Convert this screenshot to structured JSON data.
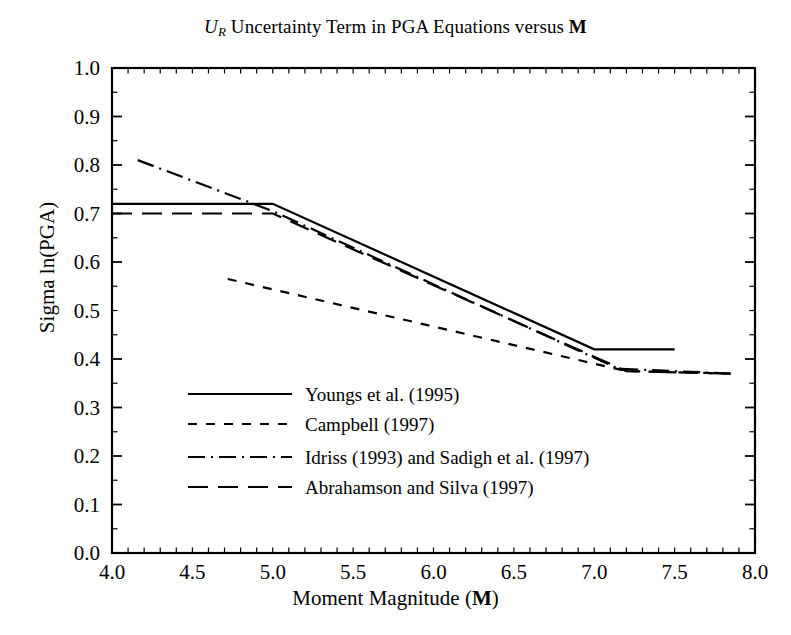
{
  "title": {
    "symbol": "U",
    "subscript": "R",
    "text_mid": " Uncertainty Term in PGA Equations versus ",
    "bold_tail": "M",
    "full": "U_R Uncertainty Term in PGA Equations versus M"
  },
  "axes": {
    "xlabel_pre": "Moment Magnitude (",
    "xlabel_bold": "M",
    "xlabel_post": ")",
    "ylabel": "Sigma ln(PGA)",
    "xticks": [
      "4.0",
      "4.5",
      "5.0",
      "5.5",
      "6.0",
      "6.5",
      "7.0",
      "7.5",
      "8.0"
    ],
    "yticks": [
      "0.0",
      "0.1",
      "0.2",
      "0.3",
      "0.4",
      "0.5",
      "0.6",
      "0.7",
      "0.8",
      "0.9",
      "1.0"
    ]
  },
  "legend": {
    "items": [
      {
        "label": "Youngs et al. (1995)",
        "style": "solid"
      },
      {
        "label": "Campbell (1997)",
        "style": "short-dash"
      },
      {
        "label": "Idriss (1993) and Sadigh et al. (1997)",
        "style": "dash-dot"
      },
      {
        "label": "Abrahamson and Silva (1997)",
        "style": "long-dash"
      }
    ]
  },
  "colors": {
    "line": "#000000",
    "axis": "#000000",
    "background": "#ffffff"
  },
  "chart_data": {
    "type": "line",
    "xlabel": "Moment Magnitude (M)",
    "ylabel": "Sigma ln(PGA)",
    "xlim": [
      4.0,
      8.0
    ],
    "ylim": [
      0.0,
      1.0
    ],
    "xticks": [
      4.0,
      4.5,
      5.0,
      5.5,
      6.0,
      6.5,
      7.0,
      7.5,
      8.0
    ],
    "yticks": [
      0.0,
      0.1,
      0.2,
      0.3,
      0.4,
      0.5,
      0.6,
      0.7,
      0.8,
      0.9,
      1.0
    ],
    "x_minor_tick_step": 0.1,
    "y_minor_tick_step": 0.05,
    "grid": false,
    "legend_position": "inside lower-left",
    "series": [
      {
        "name": "Youngs et al. (1995)",
        "style": "solid",
        "points": [
          [
            4.0,
            0.72
          ],
          [
            5.0,
            0.72
          ],
          [
            7.0,
            0.42
          ],
          [
            7.5,
            0.42
          ]
        ]
      },
      {
        "name": "Campbell (1997)",
        "style": "short-dash",
        "points": [
          [
            4.72,
            0.565
          ],
          [
            7.2,
            0.375
          ],
          [
            7.85,
            0.37
          ]
        ]
      },
      {
        "name": "Idriss (1993) and Sadigh et al. (1997)",
        "style": "dash-dot",
        "points": [
          [
            4.16,
            0.81
          ],
          [
            5.0,
            0.705
          ],
          [
            7.15,
            0.38
          ],
          [
            7.85,
            0.37
          ]
        ]
      },
      {
        "name": "Abrahamson and Silva (1997)",
        "style": "long-dash",
        "points": [
          [
            4.0,
            0.7
          ],
          [
            5.0,
            0.7
          ],
          [
            7.2,
            0.375
          ],
          [
            7.85,
            0.37
          ]
        ]
      }
    ]
  }
}
